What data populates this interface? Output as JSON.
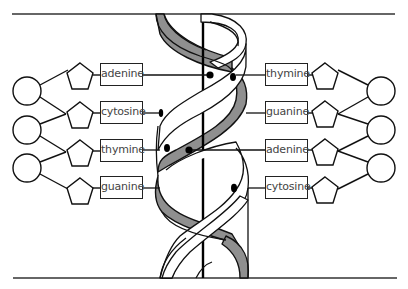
{
  "diagram": {
    "colors": {
      "stroke": "#111111",
      "ribbon_gray": "#8f8f8f",
      "background": "#ffffff",
      "label_text": "#444444"
    },
    "left_bases": [
      {
        "label": "adenine"
      },
      {
        "label": "cytosine"
      },
      {
        "label": "thymine"
      },
      {
        "label": "guanine"
      }
    ],
    "right_bases": [
      {
        "label": "thymine"
      },
      {
        "label": "guanine"
      },
      {
        "label": "adenine"
      },
      {
        "label": "cytosine"
      }
    ],
    "base_pairs": [
      {
        "left": "adenine",
        "right": "thymine"
      },
      {
        "left": "cytosine",
        "right": "guanine"
      },
      {
        "left": "thymine",
        "right": "adenine"
      },
      {
        "left": "guanine",
        "right": "cytosine"
      }
    ],
    "shapes": {
      "phosphate": "circle",
      "sugar": "pentagon",
      "base": "rectangle"
    }
  }
}
